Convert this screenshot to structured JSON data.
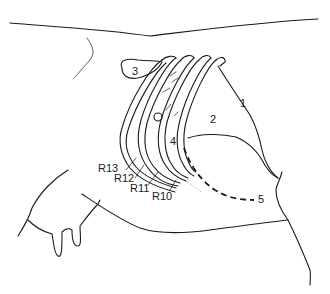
{
  "figure": {
    "line_color": "#1a1a1a",
    "background_color": "#ffffff"
  },
  "labels": {
    "region_1": "1",
    "region_2": "2",
    "region_3": "3",
    "region_4": "4",
    "region_5": "5",
    "rib_13": "R13",
    "rib_12": "R12",
    "rib_11": "R11",
    "rib_10": "R10"
  }
}
